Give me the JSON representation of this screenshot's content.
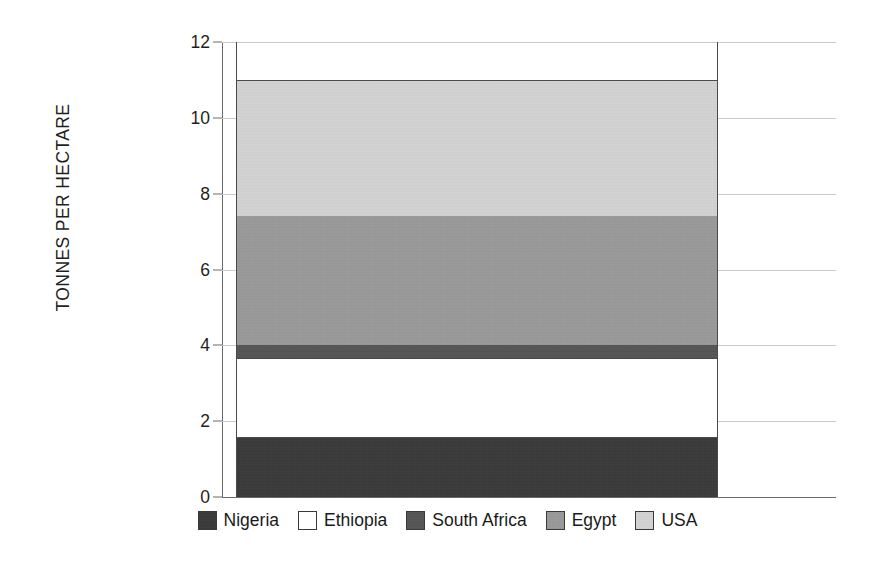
{
  "chart_data": {
    "type": "bar",
    "subtype": "stacked-single-column",
    "title": "",
    "xlabel": "",
    "ylabel": "TONNES PER HECTARE",
    "ylim": [
      0,
      12
    ],
    "yticks": [
      0,
      2,
      4,
      6,
      8,
      10,
      12
    ],
    "ytick_labels": [
      "0",
      "2",
      "4",
      "6",
      "8",
      "10",
      "12"
    ],
    "grid": true,
    "legend_position": "bottom",
    "categories": [
      ""
    ],
    "total": 11.0,
    "series": [
      {
        "name": "Nigeria",
        "values": [
          1.56
        ],
        "color": "#3a3a3a",
        "cum_start": 0.0,
        "cum_end": 1.56
      },
      {
        "name": "Ethiopia",
        "values": [
          2.11
        ],
        "color": "#ffffff",
        "cum_start": 1.56,
        "cum_end": 3.67
      },
      {
        "name": "South Africa",
        "values": [
          0.34
        ],
        "color": "#555555",
        "cum_start": 3.67,
        "cum_end": 4.01
      },
      {
        "name": "Egypt",
        "values": [
          3.4
        ],
        "color": "#999999",
        "cum_start": 4.01,
        "cum_end": 7.41
      },
      {
        "name": "USA",
        "values": [
          3.59
        ],
        "color": "#d3d3d3",
        "cum_start": 7.41,
        "cum_end": 11.0
      }
    ]
  },
  "axis": {
    "y_title": "TONNES PER HECTARE",
    "ticks": [
      {
        "label": "12",
        "value": 12
      },
      {
        "label": "10",
        "value": 10
      },
      {
        "label": "8",
        "value": 8
      },
      {
        "label": "6",
        "value": 6
      },
      {
        "label": "4",
        "value": 4
      },
      {
        "label": "2",
        "value": 2
      },
      {
        "label": "0",
        "value": 0
      }
    ]
  },
  "legend": {
    "items": [
      {
        "label": "Nigeria",
        "color": "#3a3a3a"
      },
      {
        "label": "Ethiopia",
        "color": "#ffffff"
      },
      {
        "label": "South Africa",
        "color": "#555555"
      },
      {
        "label": "Egypt",
        "color": "#999999"
      },
      {
        "label": "USA",
        "color": "#d3d3d3"
      }
    ]
  },
  "colors": {
    "background": "#ffffff",
    "gridline": "#c9c9c9",
    "axis": "#6a6a6a",
    "text": "#1a1a1a"
  }
}
